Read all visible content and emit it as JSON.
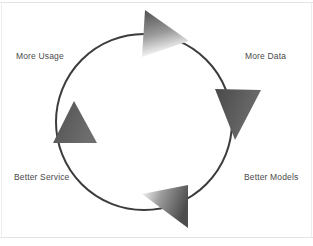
{
  "diagram": {
    "type": "cycle",
    "direction": "clockwise",
    "circle": {
      "center_x": 144,
      "center_y": 122,
      "radius": 88,
      "stroke_color": "#3c3c3c",
      "stroke_width": 2,
      "fill": "none"
    },
    "background_color": "#ffffff",
    "frame_color": "#e3e3e3",
    "label_color": "#4a4a4a",
    "labels": [
      {
        "id": "more-usage",
        "text": "More Usage",
        "position": "top-left"
      },
      {
        "id": "more-data",
        "text": "More Data",
        "position": "top-right"
      },
      {
        "id": "better-service",
        "text": "Better Service",
        "position": "bottom-left"
      },
      {
        "id": "better-models",
        "text": "Better Models",
        "position": "bottom-right"
      }
    ],
    "arrows": [
      {
        "id": "arrow-top",
        "points_to": "right",
        "at": "top",
        "gradient_from": "#4d4d4d",
        "gradient_to": "#ffffff"
      },
      {
        "id": "arrow-right",
        "points_to": "down",
        "at": "right",
        "gradient_from": "#4a4a4a",
        "gradient_to": "#6a6a6a"
      },
      {
        "id": "arrow-bottom",
        "points_to": "left",
        "at": "bottom",
        "gradient_from": "#ffffff",
        "gradient_to": "#4d4d4d"
      },
      {
        "id": "arrow-left",
        "points_to": "up",
        "at": "left",
        "gradient_from": "#4a4a4a",
        "gradient_to": "#6a6a6a"
      }
    ]
  }
}
